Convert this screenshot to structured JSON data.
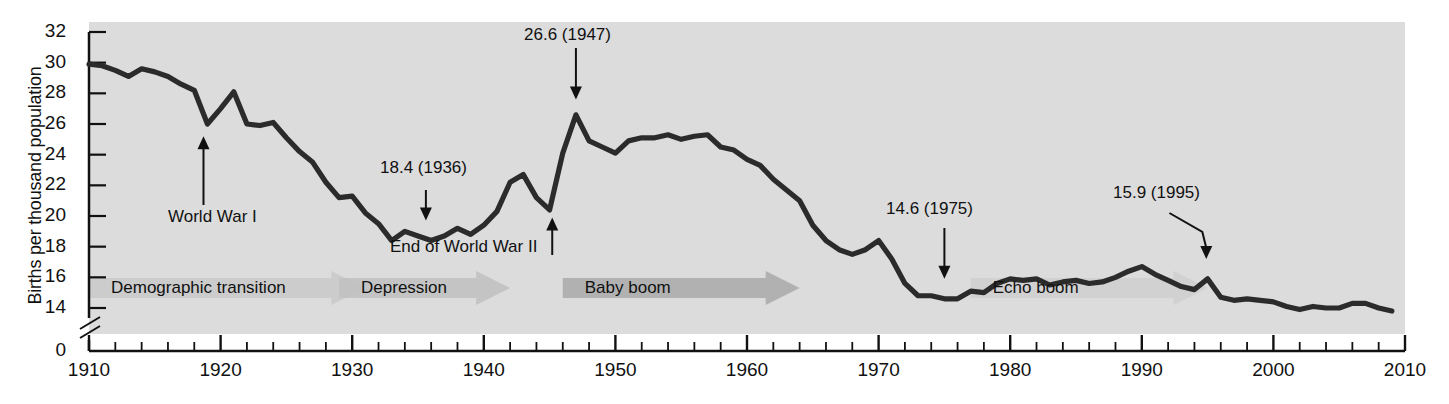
{
  "chart_data": {
    "type": "line",
    "title": "",
    "xlabel": "",
    "ylabel": "Births per thousand population",
    "xlim": [
      1910,
      2010
    ],
    "ylim": [
      14,
      32
    ],
    "y_axis_break": true,
    "y_break_from": 14,
    "y_break_to": 0,
    "grid": false,
    "legend": "none",
    "yticks": [
      "32",
      "30",
      "28",
      "26",
      "24",
      "22",
      "20",
      "18",
      "16",
      "14",
      "0"
    ],
    "ytick_values": [
      32,
      30,
      28,
      26,
      24,
      22,
      20,
      18,
      16,
      14,
      0
    ],
    "xticks": [
      "1910",
      "1920",
      "1930",
      "1940",
      "1950",
      "1960",
      "1970",
      "1980",
      "1990",
      "2000",
      "2010"
    ],
    "xtick_values": [
      1910,
      1920,
      1930,
      1940,
      1950,
      1960,
      1970,
      1980,
      1990,
      2000,
      2010
    ],
    "minor_tick_interval": 2,
    "series": [
      {
        "name": "Birth rate",
        "color": "#2b2b2b",
        "x": [
          1910,
          1911,
          1912,
          1913,
          1914,
          1915,
          1916,
          1917,
          1918,
          1919,
          1920,
          1921,
          1922,
          1923,
          1924,
          1925,
          1926,
          1927,
          1928,
          1929,
          1930,
          1931,
          1932,
          1933,
          1934,
          1935,
          1936,
          1937,
          1938,
          1939,
          1940,
          1941,
          1942,
          1943,
          1944,
          1945,
          1946,
          1947,
          1948,
          1949,
          1950,
          1951,
          1952,
          1953,
          1954,
          1955,
          1956,
          1957,
          1958,
          1959,
          1960,
          1961,
          1962,
          1963,
          1964,
          1965,
          1966,
          1967,
          1968,
          1969,
          1970,
          1971,
          1972,
          1973,
          1974,
          1975,
          1976,
          1977,
          1978,
          1979,
          1980,
          1981,
          1982,
          1983,
          1984,
          1985,
          1986,
          1987,
          1988,
          1989,
          1990,
          1991,
          1992,
          1993,
          1994,
          1995,
          1996,
          1997,
          1998,
          1999,
          2000,
          2001,
          2002,
          2003,
          2004,
          2005,
          2006,
          2007,
          2008,
          2009
        ],
        "values": [
          29.9,
          29.8,
          29.5,
          29.1,
          29.6,
          29.4,
          29.1,
          28.6,
          28.2,
          26.0,
          27.0,
          28.1,
          26.0,
          25.9,
          26.1,
          25.1,
          24.2,
          23.5,
          22.2,
          21.2,
          21.3,
          20.2,
          19.5,
          18.4,
          19.0,
          18.7,
          18.4,
          18.7,
          19.2,
          18.8,
          19.4,
          20.3,
          22.2,
          22.7,
          21.2,
          20.4,
          24.1,
          26.6,
          24.9,
          24.5,
          24.1,
          24.9,
          25.1,
          25.1,
          25.3,
          25.0,
          25.2,
          25.3,
          24.5,
          24.3,
          23.7,
          23.3,
          22.4,
          21.7,
          21.0,
          19.4,
          18.4,
          17.8,
          17.5,
          17.8,
          18.4,
          17.2,
          15.6,
          14.8,
          14.8,
          14.6,
          14.6,
          15.1,
          15.0,
          15.6,
          15.9,
          15.8,
          15.9,
          15.5,
          15.7,
          15.8,
          15.6,
          15.7,
          16.0,
          16.4,
          16.7,
          16.2,
          15.8,
          15.4,
          15.2,
          15.9,
          14.7,
          14.5,
          14.6,
          14.5,
          14.4,
          14.1,
          13.9,
          14.1,
          14.0,
          14.0,
          14.3,
          14.3,
          14.0,
          13.8
        ]
      }
    ],
    "annotations": [
      {
        "id": "ww1",
        "label": "World War I",
        "value": null,
        "year": 1918,
        "arrow": "up"
      },
      {
        "id": "d1936",
        "label": "18.4 (1936)",
        "value": 18.4,
        "year": 1936,
        "arrow": "down"
      },
      {
        "id": "ww2",
        "label": "End of World War II",
        "value": null,
        "year": 1945,
        "arrow": "up"
      },
      {
        "id": "d1947",
        "label": "26.6 (1947)",
        "value": 26.6,
        "year": 1947,
        "arrow": "down"
      },
      {
        "id": "d1975",
        "label": "14.6 (1975)",
        "value": 14.6,
        "year": 1975,
        "arrow": "down"
      },
      {
        "id": "d1995",
        "label": "15.9 (1995)",
        "value": 15.9,
        "year": 1995,
        "arrow": "down-elbow"
      }
    ],
    "era_bands": [
      {
        "id": "demographic-transition",
        "label": "Demographic transition",
        "start": 1910,
        "end": 1931,
        "color": "#c9c9c9"
      },
      {
        "id": "depression",
        "label": "Depression",
        "start": 1929,
        "end": 1942,
        "color": "#c0c0c0"
      },
      {
        "id": "baby-boom",
        "label": "Baby boom",
        "start": 1946,
        "end": 1964,
        "color": "#a9a9a9"
      },
      {
        "id": "echo-boom",
        "label": "Echo boom",
        "start": 1977,
        "end": 1995,
        "color": "#cfcfcf"
      }
    ]
  },
  "axes": {
    "y_title": "Births per thousand population"
  },
  "colors": {
    "plot_background": "#dcdcdc",
    "line": "#2b2b2b",
    "axis": "#111111",
    "text": "#111111"
  }
}
